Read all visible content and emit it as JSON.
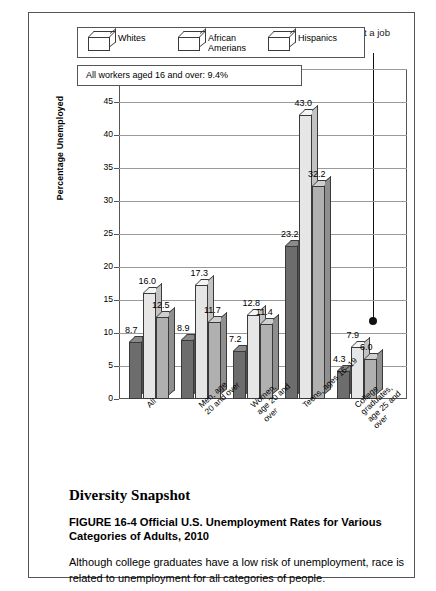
{
  "callout": {
    "bullet_glyph": "•",
    "text": "The best strategy to reduce your risk of being without a job is to complete a college education."
  },
  "note": {
    "text": "All workers aged 16 and over: 9.4%"
  },
  "chart_data": {
    "type": "bar",
    "title": "",
    "xlabel": "",
    "ylabel": "Percentage Unemployed",
    "ylim": [
      0,
      50
    ],
    "yticks": [
      0,
      5,
      10,
      15,
      20,
      25,
      30,
      35,
      40,
      45,
      50
    ],
    "grid": true,
    "legend_position": "top",
    "categories": [
      "All",
      "Men, age\n20 and over",
      "Women,\nage 20 and\nover",
      "Teens, ages 16–19",
      "College graduates,\nage 25 and over"
    ],
    "series": [
      {
        "name": "Whites",
        "color": "#6d6d6d",
        "values": [
          8.7,
          8.9,
          7.2,
          23.2,
          4.3
        ]
      },
      {
        "name": "African Amerians",
        "color": "#e6e6e6",
        "values": [
          16.0,
          17.3,
          12.8,
          43.0,
          7.9
        ]
      },
      {
        "name": "Hispanics",
        "color": "#b0b0b0",
        "values": [
          12.5,
          11.7,
          11.4,
          32.2,
          6.0
        ]
      }
    ],
    "value_labels": [
      "8.7",
      "16.0",
      "12.5",
      "8.9",
      "17.3",
      "11.7",
      "7.2",
      "12.8",
      "11.4",
      "23.2",
      "43.0",
      "32.2",
      "4.3",
      "7.9",
      "6.0"
    ]
  },
  "caption": {
    "section_title": "Diversity Snapshot",
    "figure_title": "FIGURE 16-4 Official U.S. Unemployment Rates for Various Categories of Adults, 2010",
    "body": "Although college graduates have a low risk of unemployment, race is related to unemployment for all categories of people."
  }
}
